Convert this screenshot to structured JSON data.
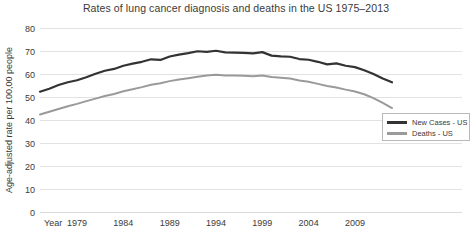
{
  "chart_data": {
    "type": "line",
    "title": "Rates of lung cancer diagnosis and deaths in the US 1975–2013",
    "xlabel": "Year",
    "ylabel": "Age-adjusted rate per 100,00 people",
    "ylim": [
      0,
      80
    ],
    "ytick_labels": [
      "0",
      "10",
      "20",
      "30",
      "40",
      "50",
      "60",
      "70",
      "80"
    ],
    "yticks": [
      0,
      10,
      20,
      30,
      40,
      50,
      60,
      70,
      80
    ],
    "xlim": [
      1975,
      2013
    ],
    "xtick_labels": [
      "1979",
      "1984",
      "1989",
      "1994",
      "1999",
      "2004",
      "2009"
    ],
    "xticks": [
      1979,
      1984,
      1989,
      1994,
      1999,
      2004,
      2009
    ],
    "grid": "horizontal",
    "legend_position": "bottom-right",
    "x": [
      1975,
      1976,
      1977,
      1978,
      1979,
      1980,
      1981,
      1982,
      1983,
      1984,
      1985,
      1986,
      1987,
      1988,
      1989,
      1990,
      1991,
      1992,
      1993,
      1994,
      1995,
      1996,
      1997,
      1998,
      1999,
      2000,
      2001,
      2002,
      2003,
      2004,
      2005,
      2006,
      2007,
      2008,
      2009,
      2010,
      2011,
      2012,
      2013
    ],
    "series": [
      {
        "name": "New Cases - US",
        "color": "#333333",
        "values": [
          52.3,
          53.6,
          55.2,
          56.4,
          57.3,
          58.6,
          60.1,
          61.4,
          62.2,
          63.6,
          64.5,
          65.3,
          66.4,
          66.1,
          67.6,
          68.4,
          69.1,
          69.9,
          69.6,
          70.1,
          69.4,
          69.3,
          69.2,
          69.0,
          69.5,
          68.0,
          67.7,
          67.5,
          66.5,
          66.2,
          65.3,
          64.2,
          64.6,
          63.6,
          63.0,
          61.6,
          60.0,
          58.0,
          56.4
        ]
      },
      {
        "name": "Deaths - US",
        "color": "#9a9a9a",
        "values": [
          42.4,
          43.6,
          44.8,
          46.0,
          47.0,
          48.2,
          49.3,
          50.4,
          51.3,
          52.5,
          53.4,
          54.3,
          55.3,
          56.0,
          56.9,
          57.6,
          58.2,
          58.8,
          59.3,
          59.7,
          59.4,
          59.4,
          59.2,
          59.0,
          59.3,
          58.7,
          58.4,
          58.0,
          57.2,
          56.6,
          55.7,
          54.8,
          54.1,
          53.2,
          52.4,
          51.2,
          49.5,
          47.4,
          45.2
        ]
      }
    ]
  },
  "legend": {
    "items": [
      {
        "label": "New Cases - US",
        "color": "#333333"
      },
      {
        "label": "Deaths - US",
        "color": "#9a9a9a"
      }
    ]
  }
}
